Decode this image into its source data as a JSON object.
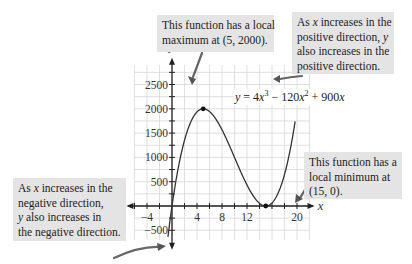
{
  "chart_data": {
    "type": "line",
    "title": "",
    "equation": "y = 4x^3 - 120x^2 + 900x",
    "xlabel": "x",
    "ylabel": "y",
    "xlim": [
      -6,
      22
    ],
    "ylim": [
      -700,
      2900
    ],
    "x_ticks": [
      -4,
      4,
      8,
      12,
      20
    ],
    "y_ticks": [
      -500,
      500,
      1000,
      1500,
      2000,
      2500
    ],
    "grid": true,
    "grid_step": {
      "x": 2,
      "y": 250
    },
    "series": [
      {
        "name": "y = 4x^3 - 120x^2 + 900x",
        "x": [
          -0.6,
          0,
          1,
          2,
          3,
          4,
          5,
          6,
          7,
          8,
          9,
          10,
          11,
          12,
          13,
          14,
          15,
          16,
          17,
          18,
          19,
          19.5
        ],
        "y": [
          -583,
          0,
          784,
          1352,
          1728,
          1936,
          2000,
          1944,
          1792,
          1568,
          1296,
          1000,
          704,
          432,
          208,
          56,
          0,
          64,
          272,
          648,
          1216,
          1593
        ]
      }
    ],
    "points": [
      {
        "label": "local maximum",
        "x": 5,
        "y": 2000
      },
      {
        "label": "local minimum",
        "x": 15,
        "y": 0
      }
    ]
  },
  "axes": {
    "x_label": "x",
    "y_label": "y",
    "x_tick_labels": [
      "−4",
      "4",
      "8",
      "12",
      "20"
    ],
    "y_tick_labels": [
      "2500",
      "2000",
      "1500",
      "1000",
      "500",
      "−500"
    ]
  },
  "equation": {
    "y": "y",
    "eq": " = 4",
    "x1": "x",
    "p1": "3",
    "minus": " − 120",
    "x2": "x",
    "p2": "2",
    "plus": " + 900",
    "x3": "x"
  },
  "callouts": {
    "maximum": {
      "lines": [
        "This function has a local",
        "maximum at (5, 2000)."
      ]
    },
    "positive": {
      "line1_pre": "As ",
      "line1_var": "x",
      "line1_post": " increases in the",
      "line2_pre": "positive direction, ",
      "line2_var": "y",
      "line3": "also increases in the",
      "line4": "positive direction."
    },
    "minimum": {
      "lines": [
        "This function has a",
        "local minimum at",
        "(15, 0)."
      ]
    },
    "negative": {
      "line1_pre": "As ",
      "line1_var": "x",
      "line1_post": " increases in the",
      "line2": "negative direction,",
      "line3_var": "y",
      "line3_post": " also increases in",
      "line4": "the negative direction."
    }
  }
}
